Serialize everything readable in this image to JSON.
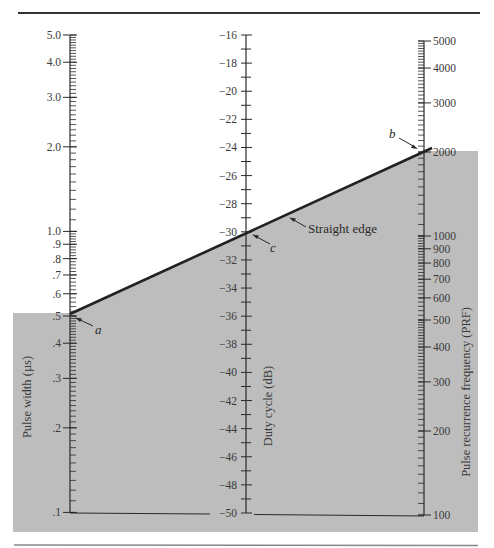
{
  "colors": {
    "shade": "#bdbdbd",
    "ink": "#2a2a2a",
    "text": "#3a3a3a",
    "rule": "#333333"
  },
  "chart_data": {
    "type": "nomogram",
    "title": "",
    "axes": [
      {
        "id": "pulse_width",
        "title": "Pulse width (µs)",
        "scale": "log",
        "range": [
          0.1,
          5.0
        ],
        "tick_labels": [
          "5.0",
          "4.0",
          "3.0",
          "2.0",
          "1.0",
          ".9",
          ".8",
          ".7",
          ".6",
          ".5",
          ".4",
          ".3",
          ".2",
          ".1"
        ],
        "tick_values": [
          5.0,
          4.0,
          3.0,
          2.0,
          1.0,
          0.9,
          0.8,
          0.7,
          0.6,
          0.5,
          0.4,
          0.3,
          0.2,
          0.1
        ]
      },
      {
        "id": "duty_cycle",
        "title": "Duty cycle (dB)",
        "scale": "linear",
        "range": [
          -50,
          -16
        ],
        "tick_labels": [
          "−16",
          "−18",
          "−20",
          "−22",
          "−24",
          "−26",
          "−28",
          "−30",
          "−32",
          "−34",
          "−36",
          "−38",
          "−40",
          "−42",
          "−44",
          "−46",
          "−48",
          "−50"
        ],
        "tick_values": [
          -16,
          -18,
          -20,
          -22,
          -24,
          -26,
          -28,
          -30,
          -32,
          -34,
          -36,
          -38,
          -40,
          -42,
          -44,
          -46,
          -48,
          -50
        ]
      },
      {
        "id": "prf",
        "title": "Pulse recurrence frequency (PRF)",
        "scale": "log",
        "range": [
          100,
          5000
        ],
        "tick_labels": [
          "5000",
          "4000",
          "3000",
          "2000",
          "1000",
          "900",
          "800",
          "700",
          "600",
          "500",
          "400",
          "300",
          "200",
          "100"
        ],
        "tick_values": [
          5000,
          4000,
          3000,
          2000,
          1000,
          900,
          800,
          700,
          600,
          500,
          400,
          300,
          200,
          100
        ]
      }
    ],
    "points": [
      {
        "label": "a",
        "axis": "pulse_width",
        "value": 0.5
      },
      {
        "label": "b",
        "axis": "prf",
        "value": 2000
      },
      {
        "label": "c",
        "axis": "duty_cycle",
        "value": -30
      }
    ],
    "annotations": [
      {
        "text": "Straight edge",
        "points_to": "line a-b"
      }
    ]
  },
  "labels": {
    "pulse_width_title": "Pulse width (µs)",
    "duty_cycle_title": "Duty cycle (dB)",
    "prf_title": "Pulse recurrence frequency (PRF)",
    "straight_edge": "Straight edge",
    "point_a": "a",
    "point_b": "b",
    "point_c": "c"
  }
}
